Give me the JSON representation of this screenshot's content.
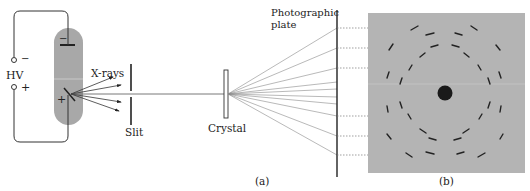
{
  "figure": {
    "panel_a_label": "(a)",
    "panel_b_label": "(b)"
  },
  "apparatus": {
    "hv_label": "HV",
    "hv_minus": "−",
    "hv_plus": "+",
    "cathode_sign": "−",
    "anode_sign": "+",
    "xrays_label": "X-rays",
    "slit_label": "Slit",
    "crystal_label": "Crystal",
    "plate_label_line1": "Photographic",
    "plate_label_line2": "plate"
  },
  "colors": {
    "tube": "#a8a8a8",
    "plate_bg": "#b4b4b4",
    "ink": "#222222",
    "ray": "#888888"
  }
}
